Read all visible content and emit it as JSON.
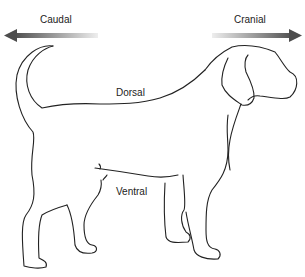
{
  "diagram": {
    "labels": {
      "caudal": "Caudal",
      "cranial": "Cranial",
      "dorsal": "Dorsal",
      "ventral": "Ventral"
    },
    "arrows": {
      "caudal": {
        "direction": "left",
        "color_dark": "#555555",
        "color_light": "#e6e6e6"
      },
      "cranial": {
        "direction": "right",
        "color_dark": "#555555",
        "color_light": "#e6e6e6"
      }
    },
    "line_color": "#222222"
  }
}
